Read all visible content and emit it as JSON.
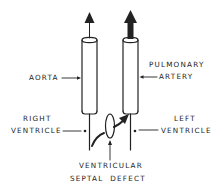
{
  "diagram": {
    "type": "anatomical-schematic",
    "colors": {
      "ink": "#222222",
      "background": "#ffffff"
    },
    "labels": {
      "aorta": "AORTA",
      "pulmonary_line1": "PULMONARY",
      "pulmonary_line2": "ARTERY",
      "right_ventricle_line1": "RIGHT",
      "right_ventricle_line2": "VENTRICLE",
      "left_ventricle_line1": "LEFT",
      "left_ventricle_line2": "VENTRICLE",
      "vsd_line1": "VENTRICULAR",
      "vsd_line2": "SEPTAL  DEFECT"
    },
    "structures": [
      {
        "name": "aorta",
        "shape": "tube",
        "outflow_arrow": "thin"
      },
      {
        "name": "pulmonary-artery",
        "shape": "tube",
        "outflow_arrow": "thick"
      },
      {
        "name": "right-ventricle",
        "marker": "dot"
      },
      {
        "name": "left-ventricle",
        "marker": "dot"
      },
      {
        "name": "ventricular-septal-defect",
        "shape": "ellipse",
        "flow": "left-to-right shunt into pulmonary artery"
      }
    ]
  }
}
